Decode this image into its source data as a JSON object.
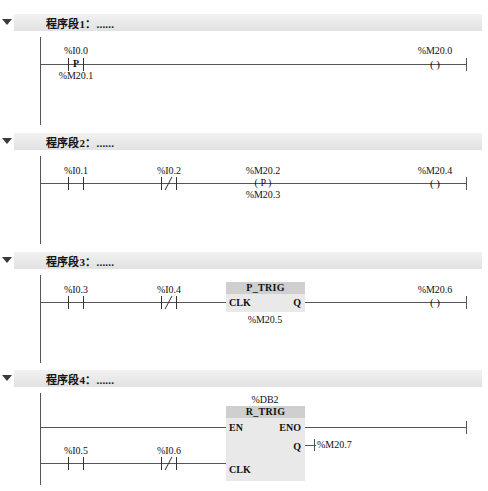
{
  "app": {
    "title": "PLC Ladder Logic (LAD) Editor"
  },
  "networks": [
    {
      "id": "network-1",
      "header": "程序段1：......",
      "collapse_icon": "triangle-down-icon",
      "elements": {
        "contact": {
          "glyph": "P",
          "label_top": "%I0.0",
          "label_bottom": "%M20.1"
        },
        "coil": {
          "glyph": "( )",
          "label": "%M20.0"
        }
      }
    },
    {
      "id": "network-2",
      "header": "程序段2：......",
      "collapse_icon": "triangle-down-icon",
      "elements": {
        "contact_no": {
          "label": "%I0.1",
          "type": "normally-open"
        },
        "contact_nc": {
          "label": "%I0.2",
          "type": "normally-closed"
        },
        "coil_p": {
          "glyph": "( P )",
          "label_top": "%M20.2",
          "label_bottom": "%M20.3"
        },
        "coil_out": {
          "glyph": "( )",
          "label": "%M20.4"
        }
      }
    },
    {
      "id": "network-3",
      "header": "程序段3：......",
      "collapse_icon": "triangle-down-icon",
      "elements": {
        "contact_no": {
          "label": "%I0.3",
          "type": "normally-open"
        },
        "contact_nc": {
          "label": "%I0.4",
          "type": "normally-closed"
        },
        "block": {
          "name": "P_TRIG",
          "input_pin": "CLK",
          "output_pin": "Q",
          "instance_label": "%M20.5"
        },
        "coil_out": {
          "glyph": "( )",
          "label": "%M20.6"
        }
      }
    },
    {
      "id": "network-4",
      "header": "程序段4：......",
      "collapse_icon": "triangle-down-icon",
      "elements": {
        "contact_no": {
          "label": "%I0.5",
          "type": "normally-open"
        },
        "contact_nc": {
          "label": "%I0.6",
          "type": "normally-closed"
        },
        "block": {
          "db_label": "%DB2",
          "name": "R_TRIG",
          "pin_en": "EN",
          "pin_eno": "ENO",
          "pin_q": "Q",
          "pin_clk": "CLK",
          "q_target": "%M20.7"
        }
      }
    }
  ],
  "colors": {
    "header_bar": "#eaeaea",
    "block_title": "#cfcfcf",
    "block_body": "#e9e9e9",
    "wire": "#555555",
    "text": "#111111"
  }
}
